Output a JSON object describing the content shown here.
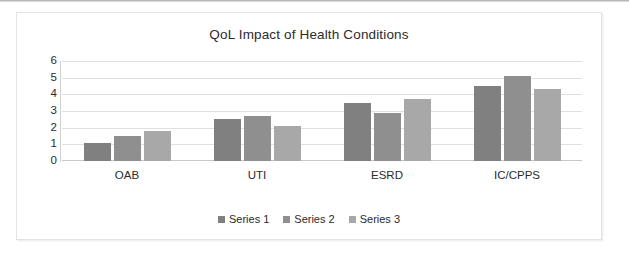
{
  "chart_data": {
    "type": "bar",
    "title": "QoL Impact of Health Conditions",
    "xlabel": "",
    "ylabel": "",
    "categories": [
      "OAB",
      "UTI",
      "ESRD",
      "IC/CPPS"
    ],
    "series": [
      {
        "name": "Series 1",
        "color": "#808080",
        "values": [
          1.1,
          2.5,
          3.5,
          4.5
        ]
      },
      {
        "name": "Series 2",
        "color": "#8f8f8f",
        "values": [
          1.5,
          2.7,
          2.9,
          5.1
        ]
      },
      {
        "name": "Series 3",
        "color": "#a8a8a8",
        "values": [
          1.8,
          2.1,
          3.7,
          4.3
        ]
      }
    ],
    "ylim": [
      0,
      6
    ],
    "yticks": [
      "0",
      "1",
      "2",
      "3",
      "4",
      "5",
      "6"
    ],
    "grid": true,
    "legend_position": "bottom",
    "gridline_color": "#e0e0e0",
    "axis_color": "#c8c8c8",
    "text_color": "#2b2b2b",
    "background": "#ffffff"
  }
}
